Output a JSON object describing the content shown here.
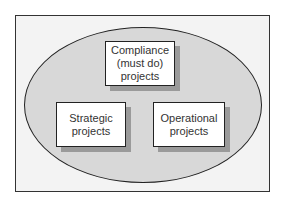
{
  "diagram": {
    "boxes": [
      {
        "id": "compliance",
        "lines": [
          "Compliance",
          "(must do)",
          "projects"
        ]
      },
      {
        "id": "strategic",
        "lines": [
          "Strategic",
          "projects"
        ]
      },
      {
        "id": "operational",
        "lines": [
          "Operational",
          "projects"
        ]
      }
    ]
  },
  "colors": {
    "frame_bg": "#f3f3f3",
    "ellipse_fill": "#d8d8d8",
    "box_fill": "#ffffff",
    "shadow": "#9a9a9a",
    "stroke": "#222222"
  }
}
